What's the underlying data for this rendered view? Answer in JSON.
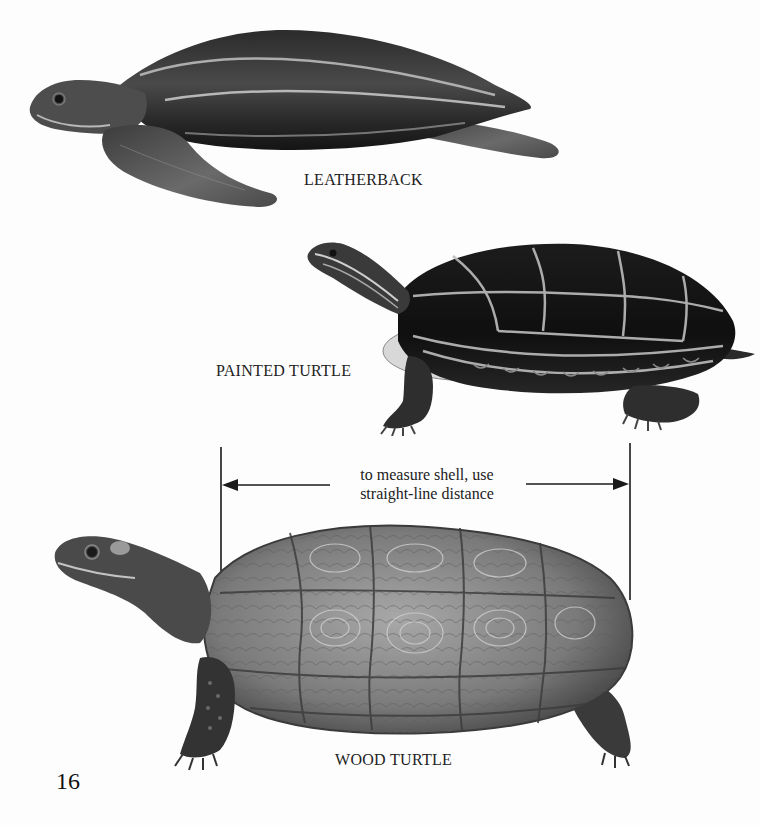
{
  "page": {
    "number": "16",
    "background_color": "#fdfdfd"
  },
  "illustrations": [
    {
      "id": "leatherback",
      "label": "LEATHERBACK",
      "icon": "leatherback-turtle-illustration"
    },
    {
      "id": "painted",
      "label": "PAINTED TURTLE",
      "icon": "painted-turtle-illustration"
    },
    {
      "id": "wood",
      "label": "WOOD TURTLE",
      "icon": "wood-turtle-illustration"
    }
  ],
  "measurement": {
    "caption_line1": "to measure shell, use",
    "caption_line2": "straight-line distance",
    "line_color": "#1a1a1a"
  }
}
